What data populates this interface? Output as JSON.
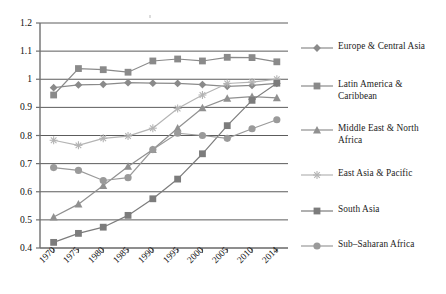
{
  "chart_data": {
    "type": "line",
    "title": "",
    "subtitle": "",
    "xlabel": "",
    "ylabel": "",
    "categories": [
      "1970",
      "1975",
      "1980",
      "1985",
      "1990",
      "1995",
      "2000",
      "2005",
      "2010",
      "2014"
    ],
    "ylim": [
      0.4,
      1.2
    ],
    "yticks": [
      "0.4",
      "0.5",
      "0.6",
      "0.7",
      "0.8",
      "0.9",
      "1",
      "1.1",
      "1.2"
    ],
    "ytick_values": [
      0.4,
      0.5,
      0.6,
      0.7,
      0.8,
      0.9,
      1.0,
      1.1,
      1.2
    ],
    "grid": true,
    "grid_axis": "y",
    "legend_position": "right",
    "series": [
      {
        "name": "Europe & Central Asia",
        "marker": "diamond",
        "color": "#8a8a8a",
        "values": [
          0.97,
          0.98,
          0.982,
          0.988,
          0.986,
          0.985,
          0.981,
          0.975,
          0.978,
          0.985
        ]
      },
      {
        "name": "Latin America & Caribbean",
        "marker": "square",
        "color": "#8a8a8a",
        "values": [
          0.944,
          1.038,
          1.034,
          1.025,
          1.065,
          1.072,
          1.065,
          1.078,
          1.077,
          1.062
        ]
      },
      {
        "name": "Middle East & North Africa",
        "marker": "triangle",
        "color": "#909090",
        "values": [
          0.51,
          0.556,
          0.622,
          0.69,
          0.75,
          0.826,
          0.898,
          0.932,
          0.938,
          0.934
        ]
      },
      {
        "name": "East Asia & Pacific",
        "marker": "star",
        "color": "#b4b4b4",
        "values": [
          0.783,
          0.765,
          0.79,
          0.798,
          0.826,
          0.896,
          0.944,
          0.985,
          0.99,
          1.0
        ]
      },
      {
        "name": "South Asia",
        "marker": "square",
        "color": "#7c7c7c",
        "values": [
          0.42,
          0.452,
          0.474,
          0.516,
          0.575,
          0.645,
          0.735,
          0.835,
          0.925,
          0.986
        ]
      },
      {
        "name": "Sub–Saharan Africa",
        "marker": "circle",
        "color": "#9a9a9a",
        "values": [
          0.686,
          0.676,
          0.64,
          0.65,
          0.75,
          0.808,
          0.8,
          0.79,
          0.824,
          0.856
        ]
      }
    ]
  },
  "axis": {
    "y_labels": [
      "1.2",
      "1.1",
      "1",
      "0.9",
      "0.8",
      "0.7",
      "0.6",
      "0.5",
      "0.4"
    ],
    "x_labels": [
      "1970",
      "1975",
      "1980",
      "1985",
      "1990",
      "1995",
      "2000",
      "2005",
      "2010",
      "2014"
    ]
  },
  "legend": {
    "items": [
      {
        "label": "Europe & Central Asia",
        "marker": "diamond-icon",
        "color": "#8a8a8a"
      },
      {
        "label": "Latin America &\nCaribbean",
        "marker": "square-icon",
        "color": "#8a8a8a"
      },
      {
        "label": "Middle East & North\nAfrica",
        "marker": "triangle-icon",
        "color": "#909090"
      },
      {
        "label": "East Asia & Pacific",
        "marker": "star-icon",
        "color": "#b4b4b4"
      },
      {
        "label": "South Asia",
        "marker": "square-icon",
        "color": "#7c7c7c"
      },
      {
        "label": "Sub–Saharan Africa",
        "marker": "circle-icon",
        "color": "#9a9a9a"
      }
    ]
  },
  "style": {
    "axis_color": "#6f6f6f",
    "grid_color": "#4a4a4a",
    "text_color": "#111111",
    "background": "#ffffff"
  }
}
